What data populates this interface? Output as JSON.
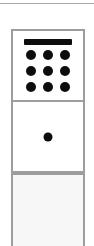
{
  "canvas": {
    "width": 94,
    "height": 246,
    "background_color": "#ffffff"
  },
  "divider": {
    "name": "top-horizontal-rule",
    "color": "#a8a8a8"
  },
  "panels": {
    "border_color": "#9d9d9d",
    "keypad_panel": {
      "label": "Keypad panel",
      "background_color": "#ffffff",
      "icon": {
        "name": "calculator-keypad-icon",
        "color": "#0d0d0d",
        "display_bar": "display-bar",
        "key_count": 9,
        "key_rows": 3,
        "key_columns": 3,
        "keys": [
          "key-1",
          "key-2",
          "key-3",
          "key-4",
          "key-5",
          "key-6",
          "key-7",
          "key-8",
          "key-9"
        ]
      }
    },
    "dot_panel": {
      "label": "Single dot panel",
      "background_color": "#ffffff",
      "icon": {
        "name": "dot-icon",
        "color": "#0d0d0d"
      }
    },
    "empty_panel": {
      "label": "Empty panel",
      "background_color": "#f7f7f7",
      "content": ""
    }
  }
}
